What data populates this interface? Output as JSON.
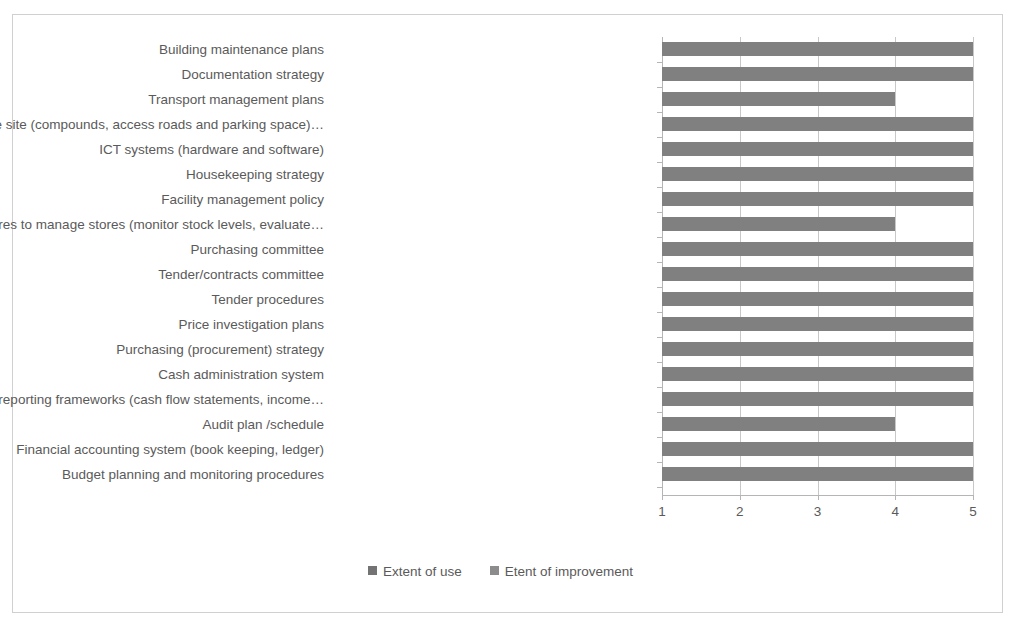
{
  "chart_data": {
    "type": "bar",
    "orientation": "horizontal",
    "title": "",
    "xlabel": "",
    "ylabel": "",
    "xlim": [
      1,
      5
    ],
    "xticks": [
      "1",
      "2",
      "3",
      "4",
      "5"
    ],
    "grid": true,
    "legend_position": "bottom",
    "categories": [
      "Building maintenance plans",
      "Documentation strategy",
      "Transport management plans",
      "Office site (compounds, access roads and parking space)…",
      "ICT systems (hardware and software)",
      "Housekeeping strategy",
      "Facility management policy",
      "Procedures to manage stores (monitor stock levels, evaluate…",
      "Purchasing committee",
      "Tender/contracts committee",
      "Tender procedures",
      "Price investigation plans",
      "Purchasing (procurement) strategy",
      "Cash administration system",
      "Financial reporting frameworks (cash flow statements, income…",
      "Audit plan /schedule",
      "Financial accounting system (book keeping, ledger)",
      "Budget planning and monitoring procedures"
    ],
    "series": [
      {
        "name": "Extent of use",
        "color": "#808080",
        "values": [
          5,
          5,
          4,
          5,
          5,
          5,
          5,
          4,
          5,
          5,
          5,
          5,
          5,
          5,
          5,
          4,
          5,
          5
        ]
      }
    ],
    "legend": [
      {
        "label": "Extent of use",
        "color": "#737373"
      },
      {
        "label": "Etent of improvement",
        "color": "#8c8c8c"
      }
    ]
  },
  "colors": {
    "bar": "#808080",
    "gridline": "#c8c8c8",
    "axis": "#b5b5b5",
    "text": "#5a5a5a",
    "border": "#d0d0d0",
    "background": "#ffffff"
  }
}
